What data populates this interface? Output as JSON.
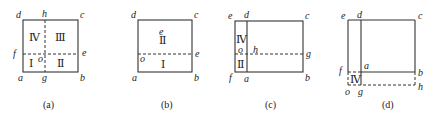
{
  "panels": [
    {
      "caption": "(a)",
      "points": {
        "a": "a",
        "b": "b",
        "c": "c",
        "d": "d",
        "e": "e",
        "f": "f",
        "g": "g",
        "h": "h",
        "o": "o"
      },
      "regions": [
        "Ⅰ",
        "Ⅱ",
        "Ⅲ",
        "Ⅳ"
      ]
    },
    {
      "caption": "(b)",
      "points": {
        "a": "a",
        "b": "b",
        "c": "c",
        "d": "d",
        "e": "e",
        "o": "o",
        "e2": "e"
      },
      "regions": [
        "Ⅰ",
        "Ⅱ"
      ]
    },
    {
      "caption": "(c)",
      "points": {
        "a": "a",
        "b": "b",
        "c": "c",
        "d": "d",
        "e": "e",
        "f": "f",
        "g": "g",
        "h": "h",
        "o": "o"
      },
      "regions": [
        "Ⅳ",
        "Ⅱ"
      ]
    },
    {
      "caption": "(d)",
      "points": {
        "a": "a",
        "b": "b",
        "c": "c",
        "d": "d",
        "e": "e",
        "f": "f",
        "g": "g",
        "h": "h",
        "o": "o"
      },
      "regions": [
        "Ⅳ"
      ]
    }
  ]
}
